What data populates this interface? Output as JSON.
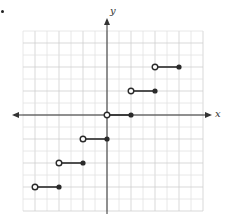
{
  "problem_marker": ".",
  "chart_data": {
    "type": "line",
    "title": "",
    "xlabel": "x",
    "ylabel": "y",
    "grid": true,
    "xlim": [
      -7,
      8
    ],
    "ylim": [
      -8,
      7
    ],
    "unit_px": 12,
    "origin_px": [
      107,
      115
    ],
    "series": [
      {
        "name": "segment",
        "x_start": -6,
        "x_end": -4,
        "y": -6,
        "start": "open",
        "end": "closed"
      },
      {
        "name": "segment",
        "x_start": -4,
        "x_end": -2,
        "y": -4,
        "start": "open",
        "end": "closed"
      },
      {
        "name": "segment",
        "x_start": -2,
        "x_end": 0,
        "y": -2,
        "start": "open",
        "end": "closed"
      },
      {
        "name": "segment",
        "x_start": 0,
        "x_end": 2,
        "y": 0,
        "start": "open",
        "end": "closed"
      },
      {
        "name": "segment",
        "x_start": 2,
        "x_end": 4,
        "y": 2,
        "start": "open",
        "end": "closed"
      },
      {
        "name": "segment",
        "x_start": 4,
        "x_end": 6,
        "y": 4,
        "start": "open",
        "end": "closed"
      }
    ]
  },
  "colors": {
    "grid_minor": "#e2e2e2",
    "grid_major": "#cfcfcf",
    "axis": "#333333",
    "segment": "#2a2a2a"
  }
}
